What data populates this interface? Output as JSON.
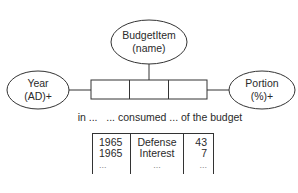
{
  "diagram": {
    "entities": [
      {
        "id": "budget-item",
        "line1": "BudgetItem",
        "line2": "(name)"
      },
      {
        "id": "year",
        "line1": "Year",
        "line2": "(AD)+"
      },
      {
        "id": "portion",
        "line1": "Portion",
        "line2": "(%)+"
      }
    ],
    "relationship_slots": 3,
    "caption": "in ...   ... consumed ... of the budget"
  },
  "table": {
    "rows": [
      [
        "1965",
        "Defense",
        "43"
      ],
      [
        "1965",
        "Interest",
        "7"
      ],
      [
        "...",
        "...",
        "..."
      ]
    ]
  },
  "colors": {
    "stroke": "#333333",
    "text": "#2a2a2a"
  }
}
